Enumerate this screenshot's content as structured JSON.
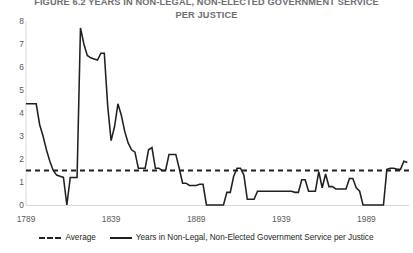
{
  "figure": {
    "title": "FIGURE 6.2  YEARS IN NON-LEGAL, NON-ELECTED GOVERNMENT SERVICE\nPER JUSTICE"
  },
  "axes": {
    "y_ticks": [
      "0",
      "1",
      "2",
      "3",
      "4",
      "5",
      "6",
      "7",
      "8"
    ],
    "x_ticks": [
      "1789",
      "1839",
      "1889",
      "1939",
      "1989"
    ]
  },
  "legend": {
    "items": [
      {
        "label": "Average",
        "style": "dashed",
        "color": "#231f20"
      },
      {
        "label": "Years in Non-Legal, Non-Elected Government Service per Justice",
        "style": "solid",
        "color": "#231f20"
      }
    ]
  },
  "chart_data": {
    "type": "line",
    "title": "FIGURE 6.2  YEARS IN NON-LEGAL, NON-ELECTED GOVERNMENT SERVICE PER JUSTICE",
    "xlabel": "",
    "ylabel": "",
    "xlim": [
      1789,
      2014
    ],
    "ylim": [
      0,
      8
    ],
    "ytick_interval": 1,
    "xtick_interval": 50,
    "grid": false,
    "legend_position": "bottom-center",
    "average_value": 1.5,
    "series": [
      {
        "name": "Average",
        "style": "dashed",
        "color": "#231f20",
        "constant": 1.5
      },
      {
        "name": "Years in Non-Legal, Non-Elected Government Service per Justice",
        "style": "solid",
        "color": "#231f20",
        "x": [
          1789,
          1791,
          1793,
          1795,
          1797,
          1799,
          1801,
          1803,
          1805,
          1807,
          1809,
          1811,
          1813,
          1815,
          1817,
          1819,
          1821,
          1823,
          1825,
          1827,
          1829,
          1831,
          1833,
          1835,
          1837,
          1839,
          1841,
          1843,
          1845,
          1847,
          1849,
          1851,
          1853,
          1855,
          1857,
          1859,
          1861,
          1863,
          1865,
          1867,
          1869,
          1871,
          1873,
          1875,
          1877,
          1879,
          1881,
          1883,
          1885,
          1887,
          1889,
          1891,
          1893,
          1895,
          1897,
          1899,
          1901,
          1903,
          1905,
          1907,
          1909,
          1911,
          1913,
          1915,
          1917,
          1919,
          1921,
          1923,
          1925,
          1927,
          1929,
          1931,
          1933,
          1935,
          1937,
          1939,
          1941,
          1943,
          1945,
          1947,
          1949,
          1951,
          1953,
          1955,
          1957,
          1959,
          1961,
          1963,
          1965,
          1967,
          1969,
          1971,
          1973,
          1975,
          1977,
          1979,
          1981,
          1983,
          1985,
          1987,
          1989,
          1991,
          1993,
          1995,
          1997,
          1999,
          2001,
          2003,
          2005,
          2007,
          2009,
          2011,
          2013
        ],
        "values": [
          4.4,
          4.4,
          4.4,
          4.4,
          3.5,
          3.0,
          2.4,
          1.9,
          1.5,
          1.3,
          1.25,
          1.2,
          0.0,
          1.2,
          1.2,
          1.2,
          7.7,
          7.0,
          6.5,
          6.4,
          6.35,
          6.3,
          6.6,
          6.6,
          4.3,
          2.8,
          3.4,
          4.4,
          3.9,
          3.2,
          2.7,
          2.4,
          2.3,
          1.6,
          1.6,
          1.6,
          2.4,
          2.5,
          1.6,
          1.6,
          1.5,
          1.5,
          2.2,
          2.2,
          2.2,
          1.6,
          0.95,
          0.95,
          0.85,
          0.85,
          0.85,
          0.9,
          0.9,
          0.0,
          0.0,
          0.0,
          0.0,
          0.0,
          0.0,
          0.55,
          0.55,
          1.25,
          1.6,
          1.6,
          1.3,
          0.25,
          0.25,
          0.25,
          0.6,
          0.6,
          0.6,
          0.6,
          0.6,
          0.6,
          0.6,
          0.6,
          0.6,
          0.6,
          0.6,
          0.55,
          0.55,
          1.1,
          1.1,
          0.6,
          0.6,
          0.6,
          1.45,
          0.75,
          1.35,
          0.8,
          0.8,
          0.7,
          0.7,
          0.7,
          0.7,
          1.15,
          1.15,
          0.75,
          0.6,
          0.0,
          0.0,
          0.0,
          0.0,
          0.0,
          0.0,
          0.0,
          1.55,
          1.6,
          1.6,
          1.55,
          1.55,
          1.9,
          1.85
        ]
      }
    ]
  }
}
